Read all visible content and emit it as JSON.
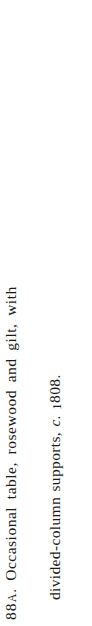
{
  "page": {
    "kind": "figure-caption",
    "orientation": "rotated-90-ccw",
    "background_color": "#ffffff",
    "text_color": "#1a1a1a"
  },
  "caption": {
    "full_text": "88A. Occasional table, rosewood and gilt, with divided-column supports, c. 1808.",
    "figure_number": {
      "digits": "88",
      "letter_suffix": "A",
      "period": "."
    },
    "lines": [
      {
        "id": "line-1",
        "text": "Occasional table, rosewood and gilt, with"
      },
      {
        "id": "line-2",
        "text_before_circa": "divided-column supports,",
        "circa": "c.",
        "year_leading": "1",
        "year_rest": "808",
        "terminal_period": "."
      }
    ]
  }
}
